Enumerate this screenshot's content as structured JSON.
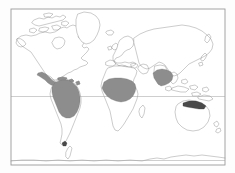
{
  "figure": {
    "type": "world-distribution-map",
    "title": "",
    "caption": "",
    "projection": "equirectangular",
    "background_color": "#ffffff",
    "frame": {
      "stroke_color": "#9a9a9a",
      "x": 11,
      "y": 9,
      "width": 214,
      "height": 156
    },
    "coastline_color": "#8e8e8e",
    "shading": {
      "range_color": "#8d8d8d",
      "range_dark_color": "#4a4a4a",
      "legend_label": ""
    },
    "gridlines": [
      {
        "name": "equator",
        "label": "",
        "y": 96.5,
        "color": "#a5a5a5"
      },
      {
        "name": "southern-boundary",
        "label": "",
        "y": 160.5,
        "color": "#a5a5a5"
      }
    ],
    "landmasses": [
      "north-america",
      "greenland",
      "south-america",
      "europe",
      "africa",
      "asia",
      "australia",
      "antarctica",
      "caribbean-islands",
      "indonesia",
      "japan",
      "new-zealand",
      "madagascar",
      "british-isles",
      "iceland"
    ],
    "shaded_regions": [
      {
        "name": "mexico-central-america",
        "label": ""
      },
      {
        "name": "caribbean",
        "label": ""
      },
      {
        "name": "amazon-basin-south-america",
        "label": ""
      },
      {
        "name": "west-central-africa",
        "label": ""
      },
      {
        "name": "indian-subcontinent-southeast-asia",
        "label": ""
      },
      {
        "name": "northern-australia",
        "label": ""
      },
      {
        "name": "tierra-del-fuego",
        "label": ""
      }
    ]
  }
}
